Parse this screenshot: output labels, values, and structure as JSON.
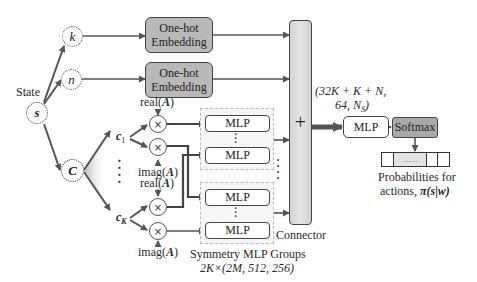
{
  "diagram": {
    "state_label": "State",
    "nodes": {
      "s": "s",
      "k": "k",
      "n": "n",
      "C": "C",
      "c1": "c",
      "c1_sub": "1",
      "cK": "c",
      "cK_sub": "K"
    },
    "embeddings": [
      {
        "line1": "One-hot",
        "line2": "Embedding"
      },
      {
        "line1": "One-hot",
        "line2": "Embedding"
      }
    ],
    "multiply_symbol": "×",
    "operand_labels": {
      "real_prefix": "real(",
      "imag_prefix": "imag(",
      "var": "A",
      "suffix": ")"
    },
    "mlp_label": "MLP",
    "vertical_ellipsis": "⋮",
    "dots": "⋮",
    "connector": {
      "symbol": "+",
      "label": "Connector"
    },
    "symmetry_group": {
      "label": "Symmetry MLP Groups",
      "dims": "2K×(2M, 512, 256)"
    },
    "final_mlp": {
      "label": "MLP",
      "dims_line1": "(32K + K + N,",
      "dims_line2": "64, N",
      "dims_line2_sub": "S",
      "dims_line2_end": ")"
    },
    "softmax": {
      "label": "Softmax"
    },
    "probability_vector": {
      "ellipsis": "……",
      "label_line1": "Probabilities for",
      "label_line2_prefix": "actions, ",
      "label_line2_math": "π(s|w)"
    },
    "colors": {
      "embedding_fill": "#b9b9b9",
      "softmax_fill": "#a9a9a9",
      "connector_fill": "#dcdcdc",
      "group_fill": "#f6f6f6",
      "stroke": "#444444"
    }
  }
}
